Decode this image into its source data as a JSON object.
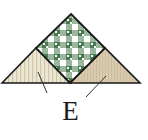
{
  "diagram": {
    "label": "E",
    "pieces": [
      {
        "name": "center-square",
        "fabric": "green gingham",
        "colors": {
          "base": "#4a7a52",
          "check": "#ffffff"
        }
      },
      {
        "name": "left-triangle",
        "fabric": "cream stripe",
        "colors": {
          "base": "#ece7d4",
          "stripe": "#cfc6a6"
        }
      },
      {
        "name": "right-triangle",
        "fabric": "tan print",
        "colors": {
          "base": "#d8cbb0",
          "stripe": "#c9b998"
        }
      }
    ],
    "outline_color": "#1a1a1a"
  }
}
